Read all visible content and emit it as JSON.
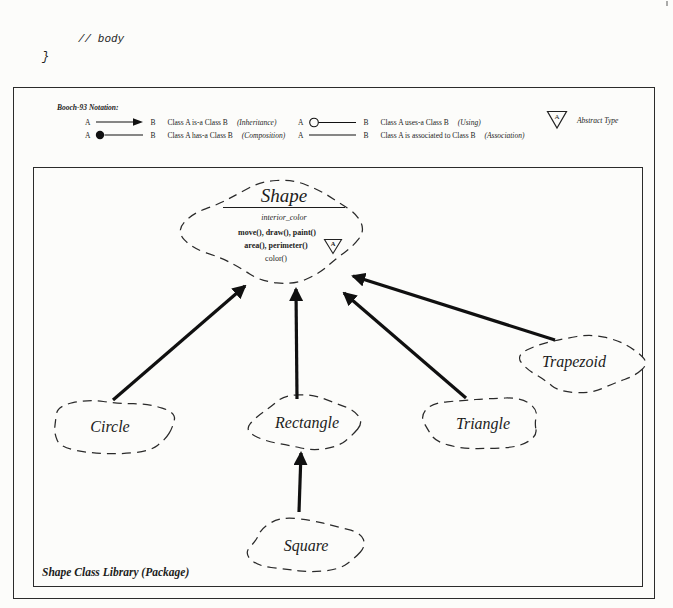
{
  "page": {
    "code_comment": "// body",
    "code_brace": "}"
  },
  "colors": {
    "ink": "#1c1c1c",
    "paper": "#fcfcfa"
  },
  "legend": {
    "title": "Booch-93 Notation:",
    "left": [
      {
        "a": "A",
        "b": "B",
        "text": "Class A is-a Class B",
        "relation": "(Inheritance)"
      },
      {
        "a": "A",
        "b": "B",
        "text": "Class A has-a Class B",
        "relation": "(Composition)"
      }
    ],
    "right": [
      {
        "a": "A",
        "b": "B",
        "text": "Class A uses-a Class B",
        "relation": "(Using)"
      },
      {
        "a": "A",
        "b": "B",
        "text": "Class A is associated to Class B",
        "relation": "(Association)"
      }
    ],
    "abstract": {
      "letter": "A",
      "label": "Abstract Type"
    }
  },
  "diagram": {
    "caption": "Shape Class Library (Package)",
    "shape": {
      "name": "Shape",
      "attribute": "interior_color",
      "methods": [
        "move(), draw(), paint()",
        "area(), perimeter()",
        "color()"
      ],
      "abstract_letter": "A"
    },
    "subclasses": [
      {
        "name": "Circle"
      },
      {
        "name": "Rectangle"
      },
      {
        "name": "Triangle"
      },
      {
        "name": "Trapezoid"
      },
      {
        "name": "Square"
      }
    ],
    "relations": [
      {
        "from": "Circle",
        "to": "Shape",
        "type": "inheritance"
      },
      {
        "from": "Rectangle",
        "to": "Shape",
        "type": "inheritance"
      },
      {
        "from": "Triangle",
        "to": "Shape",
        "type": "inheritance"
      },
      {
        "from": "Trapezoid",
        "to": "Shape",
        "type": "inheritance"
      },
      {
        "from": "Square",
        "to": "Rectangle",
        "type": "inheritance"
      }
    ]
  }
}
